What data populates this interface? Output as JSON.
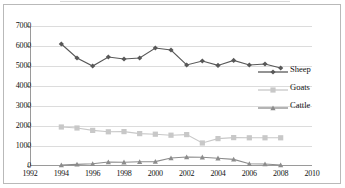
{
  "chart_data": {
    "type": "line",
    "title": "",
    "subtitle": "",
    "xlabel": "",
    "ylabel": "",
    "xlim": [
      1992,
      2010
    ],
    "ylim": [
      0,
      7000
    ],
    "grid": true,
    "legend_position": "right",
    "x": [
      1994,
      1995,
      1996,
      1997,
      1998,
      1999,
      2000,
      2001,
      2002,
      2003,
      2004,
      2005,
      2006,
      2007,
      2008
    ],
    "x_tick_labels": [
      "1992",
      "1994",
      "1996",
      "1998",
      "2000",
      "2002",
      "2004",
      "2006",
      "2008",
      "2010"
    ],
    "x_ticks": [
      1992,
      1994,
      1996,
      1998,
      2000,
      2002,
      2004,
      2006,
      2008,
      2010
    ],
    "y_tick_labels": [
      "0",
      "1000",
      "2000",
      "3000",
      "4000",
      "5000",
      "6000",
      "7000"
    ],
    "y_ticks": [
      0,
      1000,
      2000,
      3000,
      4000,
      5000,
      6000,
      7000
    ],
    "series": [
      {
        "name": "Sheep",
        "marker": "diamond",
        "color": "#585858",
        "values": [
          6100,
          5400,
          5000,
          5450,
          5350,
          5400,
          5900,
          5800,
          5050,
          5250,
          5030,
          5280,
          5050,
          5100,
          4900
        ]
      },
      {
        "name": "Goats",
        "marker": "square",
        "color": "#c8c8c8",
        "values": [
          1950,
          1900,
          1780,
          1710,
          1720,
          1620,
          1590,
          1540,
          1570,
          1150,
          1370,
          1420,
          1410,
          1410,
          1410
        ]
      },
      {
        "name": "Cattle",
        "marker": "triangle",
        "color": "#8c8c8c",
        "values": [
          50,
          80,
          110,
          200,
          190,
          210,
          220,
          400,
          450,
          440,
          390,
          330,
          110,
          100,
          50
        ]
      }
    ]
  },
  "legend": {
    "items": [
      {
        "label": "Sheep"
      },
      {
        "label": "Goats"
      },
      {
        "label": "Cattle"
      }
    ]
  }
}
